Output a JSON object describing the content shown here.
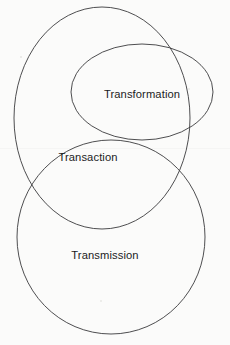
{
  "diagram": {
    "type": "venn-euler",
    "title": "",
    "background_color": "#fbfbfa",
    "stroke_color": "#3a3a3c",
    "text_color": "#1b1b1d",
    "canvas": {
      "width": 230,
      "height": 345
    },
    "sets": [
      {
        "id": "transformation",
        "label": "Transformation",
        "shape": "ellipse",
        "cx": 142,
        "cy": 92,
        "rx": 71,
        "ry": 48,
        "label_x": 142,
        "label_y": 95
      },
      {
        "id": "transaction",
        "label": "Transaction",
        "shape": "ellipse",
        "cx": 102,
        "cy": 118,
        "rx": 88,
        "ry": 111,
        "label_x": 88,
        "label_y": 158
      },
      {
        "id": "transmission",
        "label": "Transmission",
        "shape": "ellipse",
        "cx": 111,
        "cy": 237,
        "rx": 94,
        "ry": 97,
        "label_x": 105,
        "label_y": 256
      }
    ],
    "relationships": [
      "Transformation overlaps Transaction",
      "Transaction overlaps Transmission",
      "Transformation overlaps Transmission"
    ]
  }
}
